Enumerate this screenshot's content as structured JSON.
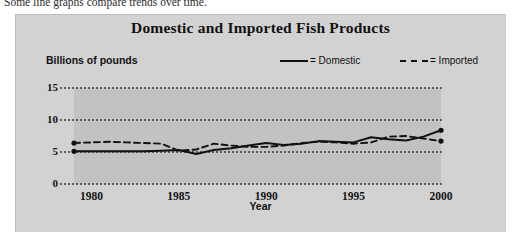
{
  "caption": "Some line graphs compare trends over time.",
  "figure": {
    "title": "Domestic and Imported Fish Products",
    "y_axis_title": "Billions of pounds",
    "x_axis_title": "Year",
    "legend": [
      {
        "name": "domestic",
        "label": "= Domestic",
        "style": "solid"
      },
      {
        "name": "imported",
        "label": "= Imported",
        "style": "dashed"
      }
    ],
    "colors": {
      "panel_background": "#d2d2d2",
      "plot_background": "#c2c2c2",
      "line": "#111111",
      "gridline": "#3a3a3a",
      "page_background": "#ffffff"
    }
  },
  "chart_data": {
    "type": "line",
    "title": "Domestic and Imported Fish Products",
    "xlabel": "Year",
    "ylabel": "Billions of pounds",
    "xlim": [
      1979,
      2000
    ],
    "ylim": [
      0,
      15
    ],
    "yticks": [
      0,
      5,
      10,
      15
    ],
    "xticks": [
      1980,
      1985,
      1990,
      1995,
      2000
    ],
    "grid": true,
    "legend_position": "top-right",
    "x": [
      1979,
      1980,
      1981,
      1982,
      1983,
      1984,
      1985,
      1986,
      1987,
      1988,
      1989,
      1990,
      1991,
      1992,
      1993,
      1994,
      1995,
      1996,
      1997,
      1998,
      1999,
      2000
    ],
    "series": [
      {
        "name": "Domestic",
        "style": "solid",
        "values": [
          5.1,
          5.1,
          5.1,
          5.1,
          5.1,
          5.2,
          5.3,
          4.7,
          5.3,
          5.6,
          6.0,
          6.4,
          6.1,
          6.3,
          6.7,
          6.6,
          6.5,
          7.3,
          7.0,
          6.8,
          7.4,
          8.4
        ]
      },
      {
        "name": "Imported",
        "style": "dashed",
        "values": [
          6.4,
          6.5,
          6.6,
          6.5,
          6.4,
          6.3,
          5.2,
          5.4,
          6.3,
          6.0,
          5.8,
          5.8,
          6.0,
          6.4,
          6.6,
          6.5,
          6.3,
          6.5,
          7.4,
          7.5,
          7.1,
          6.7
        ]
      }
    ]
  }
}
